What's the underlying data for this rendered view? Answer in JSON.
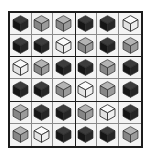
{
  "puzzle": {
    "kind": "cube-sudoku-grid",
    "rows": 6,
    "columns": 6,
    "block_rows": 2,
    "block_columns": 3,
    "symbols": [
      "dark",
      "gray",
      "white"
    ],
    "colors": {
      "dark_top": "#3c3c3c",
      "dark_left": "#151515",
      "dark_right": "#262626",
      "gray_top": "#b4b4b4",
      "gray_left": "#868686",
      "gray_right": "#9b9b9b",
      "white_top": "#fbfbfb",
      "white_left": "#e2e2e2",
      "white_right": "#efefef",
      "cube_outline": "#2a2a2a",
      "grid_thick_border": "#1c1c1c",
      "grid_thin_border": "#8a8a8a",
      "cell_background": "#f4f4f4",
      "page_background": "#ffffff"
    },
    "blocks": [
      {
        "name": "block-top-left",
        "cells": [
          [
            "dark",
            "gray",
            "gray"
          ],
          [
            "dark",
            "dark",
            "white"
          ]
        ]
      },
      {
        "name": "block-top-right",
        "cells": [
          [
            "dark",
            "dark",
            "white"
          ],
          [
            "gray",
            "dark",
            "gray"
          ]
        ]
      },
      {
        "name": "block-middle-left",
        "cells": [
          [
            "white",
            "gray",
            "dark"
          ],
          [
            "dark",
            "dark",
            "gray"
          ]
        ]
      },
      {
        "name": "block-middle-right",
        "cells": [
          [
            "dark",
            "gray",
            "dark"
          ],
          [
            "white",
            "gray",
            "dark"
          ]
        ]
      },
      {
        "name": "block-bottom-left",
        "cells": [
          [
            "gray",
            "dark",
            "dark"
          ],
          [
            "gray",
            "white",
            "dark"
          ]
        ]
      },
      {
        "name": "block-bottom-right",
        "cells": [
          [
            "gray",
            "white",
            "dark"
          ],
          [
            "dark",
            "dark",
            "gray"
          ]
        ]
      }
    ]
  }
}
